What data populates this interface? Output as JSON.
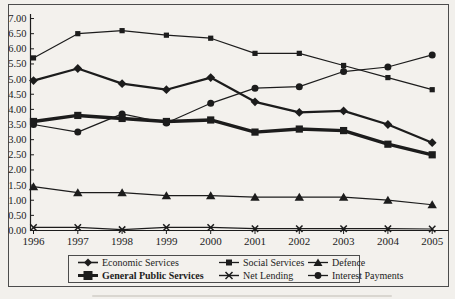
{
  "figure": {
    "background": "#f2f0ec",
    "ink_color": "#1c1c1c",
    "frame_color": "#4c4c4c"
  },
  "chart_data": {
    "type": "line",
    "title": "",
    "xlabel": "",
    "ylabel": "",
    "x": [
      "1996",
      "1997",
      "1998",
      "1999",
      "2000",
      "2001",
      "2002",
      "2003",
      "2004",
      "2005"
    ],
    "ylim": [
      0,
      7
    ],
    "ytick_step": 0.5,
    "y_tick_labels": [
      "0.00",
      "0.50",
      "1.00",
      "1.50",
      "2.00",
      "2.50",
      "3.00",
      "3.50",
      "4.00",
      "4.50",
      "5.00",
      "5.50",
      "6.00",
      "6.50",
      "7.00"
    ],
    "grid": false,
    "legend_position": "bottom-box",
    "series": [
      {
        "name": "Economic Services",
        "marker": "diamond",
        "thickness": "medium",
        "values": [
          4.95,
          5.35,
          4.85,
          4.65,
          5.05,
          4.25,
          3.9,
          3.95,
          3.5,
          2.9
        ]
      },
      {
        "name": "Social Services",
        "marker": "square-small",
        "thickness": "thin",
        "values": [
          5.7,
          6.5,
          6.6,
          6.45,
          6.35,
          5.85,
          5.85,
          5.45,
          5.05,
          4.65
        ]
      },
      {
        "name": "Defence",
        "marker": "triangle",
        "thickness": "thin",
        "values": [
          1.45,
          1.25,
          1.25,
          1.15,
          1.15,
          1.1,
          1.1,
          1.1,
          1.0,
          0.85
        ]
      },
      {
        "name": "General Public Services",
        "marker": "square-large",
        "thickness": "thick",
        "values": [
          3.6,
          3.8,
          3.7,
          3.6,
          3.65,
          3.25,
          3.35,
          3.3,
          2.85,
          2.5
        ]
      },
      {
        "name": "Net Lending",
        "marker": "x",
        "thickness": "thin",
        "values": [
          0.1,
          0.1,
          0.03,
          0.1,
          0.1,
          0.06,
          0.06,
          0.06,
          0.06,
          0.05
        ]
      },
      {
        "name": "Interest Payments",
        "marker": "circle",
        "thickness": "thin",
        "values": [
          3.5,
          3.25,
          3.85,
          3.55,
          4.2,
          4.7,
          4.75,
          5.25,
          5.4,
          5.8
        ]
      }
    ]
  }
}
